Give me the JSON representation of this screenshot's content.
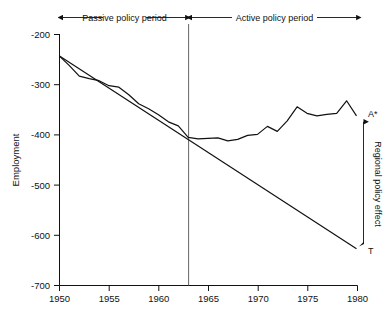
{
  "chart_data": {
    "type": "line",
    "title": "",
    "xlabel": "",
    "ylabel": "Employment",
    "xlim": [
      1950,
      1980
    ],
    "ylim": [
      -700,
      -200
    ],
    "grid": false,
    "legend_position": "none",
    "xticks": [
      "1950",
      "1955",
      "1960",
      "1965",
      "1970",
      "1975",
      "1980"
    ],
    "xtick_values": [
      1950,
      1955,
      1960,
      1965,
      1970,
      1975,
      1980
    ],
    "yticks": [
      "-200",
      "-300",
      "-400",
      "-500",
      "-600",
      "-700"
    ],
    "ytick_values": [
      -200,
      -300,
      -400,
      -500,
      -600,
      -700
    ],
    "x": [
      1950,
      1951,
      1952,
      1953,
      1954,
      1955,
      1956,
      1957,
      1958,
      1959,
      1960,
      1961,
      1962,
      1963,
      1964,
      1965,
      1966,
      1967,
      1968,
      1969,
      1970,
      1971,
      1972,
      1973,
      1974,
      1975,
      1976,
      1977,
      1978,
      1979,
      1980
    ],
    "series": [
      {
        "name": "Actual employment",
        "values": [
          -243,
          -262,
          -283,
          -288,
          -292,
          -302,
          -305,
          -320,
          -338,
          -348,
          -360,
          -374,
          -382,
          -405,
          -408,
          -407,
          -406,
          -412,
          -409,
          -401,
          -399,
          -383,
          -393,
          -372,
          -344,
          -357,
          -362,
          -359,
          -357,
          -332,
          -362
        ]
      },
      {
        "name": "Extrapolated trend",
        "values": [
          -243,
          -256,
          -269,
          -281,
          -294,
          -307,
          -320,
          -333,
          -345,
          -358,
          -371,
          -384,
          -397,
          -409,
          -422,
          -435,
          -448,
          -460,
          -473,
          -486,
          -499,
          -512,
          -524,
          -537,
          -550,
          -563,
          -576,
          -588,
          -601,
          -614,
          -627
        ]
      }
    ],
    "annotations": {
      "passive_period_label": "Passive policy period",
      "active_period_label": "Active policy period",
      "period_split_year": 1963,
      "policy_effect_label": "Regional policy effect",
      "actual_endpoint_label": "A*",
      "trend_endpoint_label": "T",
      "actual_endpoint_value": -362,
      "trend_endpoint_value": -627
    }
  }
}
